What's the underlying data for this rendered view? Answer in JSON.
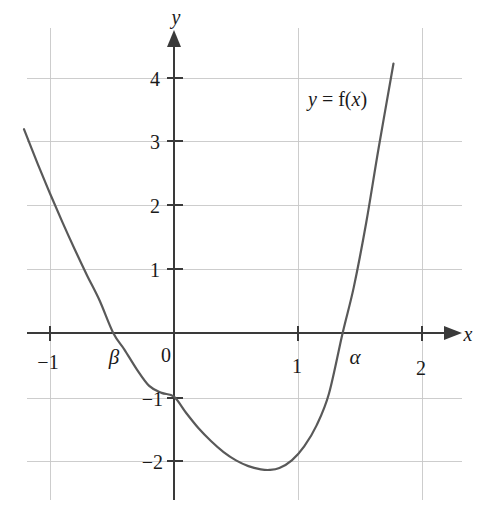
{
  "figure": {
    "background_color": "#ffffff",
    "curve_color": "#595959",
    "axis_color": "#3a3a3a",
    "grid_color": "#c8c8c8"
  },
  "labels": {
    "x_axis": "x",
    "y_axis": "y",
    "curve": {
      "lhs": "y",
      "eq": " = ",
      "fn": "f(",
      "arg": "x",
      "close": ")"
    },
    "curve_full": "y = f(x)",
    "root_alpha": "α",
    "root_beta": "β"
  },
  "chart_data": {
    "type": "line",
    "title": "",
    "subtitle": "",
    "xlabel": "x",
    "ylabel": "y",
    "xlim": [
      -1.4,
      2.35
    ],
    "ylim": [
      -2.6,
      4.75
    ],
    "grid": true,
    "legend": "none",
    "x_ticks": [
      -1,
      0,
      1,
      2
    ],
    "x_tick_labels": [
      "−1",
      "0",
      "1",
      "2"
    ],
    "y_ticks": [
      1,
      2,
      3,
      4
    ],
    "y_tick_labels": [
      "1",
      "2",
      "3",
      "4"
    ],
    "y_ticks_negative": [
      -1,
      -2
    ],
    "y_tick_labels_negative": [
      "−1",
      "−2"
    ],
    "annotations": [
      {
        "text": "y = f(x)",
        "x": 1.0,
        "y": 3.55
      },
      {
        "text": "β",
        "x": -0.47,
        "y": -0.38
      },
      {
        "text": "α",
        "x": 1.44,
        "y": -0.38
      }
    ],
    "series": [
      {
        "name": "f(x)",
        "color": "#595959",
        "x": [
          -1.21,
          -1.1,
          -1.0,
          -0.9,
          -0.8,
          -0.7,
          -0.6,
          -0.49,
          -0.4,
          -0.3,
          -0.2,
          -0.1,
          0.0,
          0.1,
          0.2,
          0.3,
          0.4,
          0.5,
          0.6,
          0.7,
          0.77,
          0.85,
          0.95,
          1.05,
          1.15,
          1.25,
          1.36,
          1.45,
          1.55,
          1.65,
          1.77
        ],
        "y": [
          3.2,
          2.66,
          2.19,
          1.74,
          1.31,
          0.9,
          0.51,
          0.0,
          -0.26,
          -0.57,
          -0.83,
          -0.94,
          -1.0,
          -1.26,
          -1.5,
          -1.7,
          -1.87,
          -2.0,
          -2.09,
          -2.14,
          -2.15,
          -2.12,
          -2.0,
          -1.78,
          -1.45,
          -0.95,
          0.0,
          0.72,
          1.73,
          2.9,
          4.23
        ],
        "roots": [
          -0.49,
          1.36
        ],
        "minimum": {
          "x": 0.77,
          "y": -2.15
        },
        "y_intercept": -1.0
      }
    ],
    "notes": {
      "root_symbol_left": "β",
      "root_symbol_right": "α",
      "root_value_left": -0.49,
      "root_value_right": 1.36
    }
  },
  "geometry": {
    "origin_px": {
      "x": 174,
      "y": 333
    },
    "unit_px": {
      "x": 124,
      "y": 63.7
    },
    "grid_x_extent_px": {
      "min": 27,
      "max": 462
    },
    "grid_y_extent_px": {
      "min": 28,
      "max": 500
    },
    "x_axis_arrow_tip_px": 452,
    "y_axis_arrow_tip_px": 36
  }
}
